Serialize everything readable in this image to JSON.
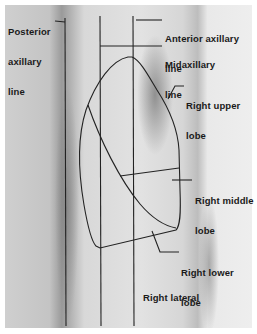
{
  "figure": {
    "view": "Right lateral",
    "reference_lines": [
      {
        "id": "posterior",
        "label_line1": "Posterior",
        "label_line2": "axillary",
        "label_line3": "line"
      },
      {
        "id": "midaxillary",
        "label_line1": "Midaxillary",
        "label_line2": "line"
      },
      {
        "id": "anterior",
        "label_line1": "Anterior axillary",
        "label_line2": "line"
      }
    ],
    "lobes": [
      {
        "id": "upper",
        "label_line1": "Right upper",
        "label_line2": "lobe"
      },
      {
        "id": "middle",
        "label_line1": "Right middle",
        "label_line2": "lobe"
      },
      {
        "id": "lower",
        "label_line1": "Right lower",
        "label_line2": "lobe"
      }
    ],
    "colors": {
      "line": "#222222",
      "background": "#ffffff"
    }
  }
}
